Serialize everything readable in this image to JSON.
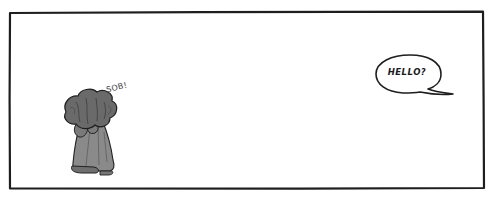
{
  "panel": {
    "background": "#ffffff",
    "border_color": "#1e1e1e"
  },
  "character": {
    "description": "crying figure with bushy hair, kneeling, face buried in hands",
    "sound_effect": "SOB!"
  },
  "speech_bubble": {
    "text": "HELLO?"
  }
}
